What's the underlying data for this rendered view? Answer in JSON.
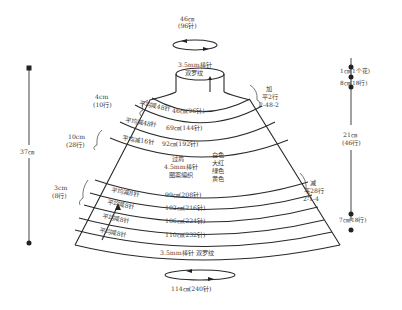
{
  "top": {
    "circumference": "46㎝",
    "stitches": "(96针)",
    "needle": "3.5mm棒针",
    "pattern": "双罗纹"
  },
  "bottom": {
    "needle_pattern": "3.5mm棒针  双罗纹",
    "circumference": "114㎝(240针)"
  },
  "left_measure": {
    "total": "37㎝",
    "seg1_len": "4cm",
    "seg1_rows": "(10行)",
    "seg2_len": "10cm",
    "seg2_rows": "(28行)",
    "seg3_len": "3cm",
    "seg3_rows": "(8行)"
  },
  "right_increase": {
    "title": "加",
    "flat": "平2行",
    "formula": "2-48-2"
  },
  "right_decrease": {
    "title": "减",
    "flat": "平28行",
    "formula": "2-1-4"
  },
  "right_scale": {
    "top_seg": "1㎝(1个花)",
    "seg2": "8㎝(18行)",
    "middle_len": "21㎝",
    "middle_rows": "(46行)",
    "bottom_seg": "7㎝(18行)"
  },
  "yoke_bands": [
    {
      "decrease": "平均减48针",
      "size": "46㎝(96针)"
    },
    {
      "decrease": "平均减48针",
      "size": "69㎝(144针)"
    },
    {
      "decrease": "平均减16针",
      "size": "92㎝(192针)"
    }
  ],
  "pattern_section": {
    "line1": "过肩",
    "line2": "4.5mm棒针",
    "line3": "图案编织",
    "colors": [
      "白色",
      "大红",
      "绿色",
      "黄色"
    ]
  },
  "lower_bands": [
    {
      "decrease": "平均减8针",
      "size": "99㎝(208针)"
    },
    {
      "decrease": "平均减8针",
      "size": "102㎝(216针)"
    },
    {
      "decrease": "平均减8针",
      "size": "106㎝(224针)"
    },
    {
      "decrease": "平均减8针",
      "size": "110㎝(232针)"
    }
  ]
}
